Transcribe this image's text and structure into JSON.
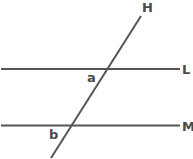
{
  "diagram": {
    "type": "parallel-lines-transversal",
    "line_color": "#555555",
    "label_color": "#4a4a4a",
    "lines": {
      "L": {
        "label": "L",
        "x1": 1,
        "y1": 69,
        "x2": 180,
        "y2": 69
      },
      "M": {
        "label": "M",
        "x1": 1,
        "y1": 125.5,
        "x2": 180,
        "y2": 125.5
      },
      "H": {
        "label": "H",
        "x1": 141,
        "y1": 16,
        "x2": 51,
        "y2": 158
      }
    },
    "angles": {
      "a": {
        "label": "a"
      },
      "b": {
        "label": "b"
      }
    }
  }
}
